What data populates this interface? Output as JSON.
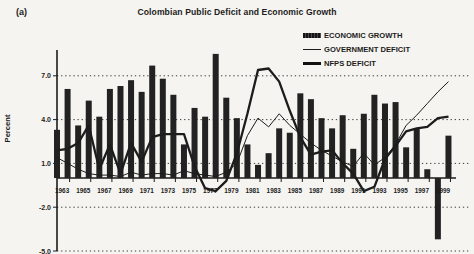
{
  "panel_label": "(a)",
  "title": "Colombian Public Deficit and Economic Growth",
  "ylabel": "Percent",
  "legend": [
    {
      "label": "ECONOMIC GROWTH",
      "swatch": "bar-swatch"
    },
    {
      "label": "GOVERNMENT DEFICIT",
      "swatch": "thin-line-swatch"
    },
    {
      "label": "NFPS DEFICIT",
      "swatch": "thick-line-swatch"
    }
  ],
  "colors": {
    "ink": "#1c1c1c",
    "paper": "#f5f4f0",
    "bar_fill": "#222222"
  },
  "chart_data": {
    "type": "bar",
    "title": "Colombian Public Deficit and Economic Growth",
    "xlabel": "",
    "ylabel": "Percent",
    "x": [
      1963,
      1964,
      1965,
      1966,
      1967,
      1968,
      1969,
      1970,
      1971,
      1972,
      1973,
      1974,
      1975,
      1976,
      1977,
      1978,
      1979,
      1980,
      1981,
      1982,
      1983,
      1984,
      1985,
      1986,
      1987,
      1988,
      1989,
      1990,
      1991,
      1992,
      1993,
      1994,
      1995,
      1996,
      1997,
      1998,
      1999,
      2000
    ],
    "xtick_labels": [
      "1963",
      "1965",
      "1967",
      "1969",
      "1971",
      "1973",
      "1975",
      "1977",
      "1979",
      "1981",
      "1983",
      "1985",
      "1987",
      "1989",
      "1991",
      "1993",
      "1995",
      "1997",
      "1999"
    ],
    "yticks": [
      7.0,
      4.0,
      1.0,
      -2.0,
      -5.0
    ],
    "ytick_labels": [
      "7.0",
      "4.0",
      "1.0",
      "-2.0",
      "-5.0"
    ],
    "ylim": [
      -5.2,
      8.7
    ],
    "grid": "horizontal-dotted",
    "legend_position": "top-right",
    "series": [
      {
        "name": "ECONOMIC GROWTH",
        "type": "bar",
        "values": [
          3.3,
          6.1,
          3.6,
          5.3,
          4.2,
          6.1,
          6.3,
          6.7,
          5.9,
          7.7,
          6.8,
          5.7,
          2.3,
          4.8,
          4.2,
          8.5,
          5.5,
          4.1,
          2.3,
          0.9,
          1.7,
          3.4,
          3.1,
          5.8,
          5.4,
          4.1,
          3.4,
          4.3,
          2.0,
          4.4,
          5.7,
          5.1,
          5.2,
          2.1,
          3.4,
          0.6,
          -4.2,
          2.9
        ]
      },
      {
        "name": "GOVERNMENT DEFICIT",
        "type": "line",
        "stroke": "thin",
        "values": [
          1.4,
          1.0,
          0.6,
          0.3,
          0.2,
          0.2,
          0.1,
          0.4,
          0.2,
          0.3,
          0.3,
          0.2,
          0.5,
          0.3,
          0.2,
          0.1,
          0.4,
          1.0,
          2.9,
          4.1,
          3.5,
          4.4,
          3.6,
          3.0,
          2.4,
          1.9,
          1.5,
          1.1,
          0.8,
          1.7,
          0.9,
          1.4,
          2.3,
          3.6,
          4.3,
          5.1,
          5.9,
          6.6
        ]
      },
      {
        "name": "NFPS DEFICIT",
        "type": "line",
        "stroke": "thick",
        "values": [
          1.9,
          2.0,
          2.4,
          3.6,
          0.6,
          2.3,
          0.3,
          2.4,
          1.1,
          2.8,
          3.0,
          3.0,
          3.0,
          0.8,
          -0.7,
          -0.9,
          -0.2,
          1.7,
          4.4,
          7.4,
          7.5,
          6.6,
          4.6,
          2.8,
          1.6,
          1.8,
          1.9,
          1.0,
          0.3,
          -0.9,
          -0.6,
          1.3,
          2.2,
          3.2,
          3.4,
          3.5,
          4.1,
          4.2
        ]
      }
    ]
  }
}
